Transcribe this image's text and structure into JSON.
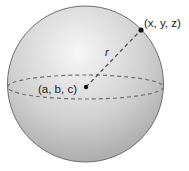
{
  "diagram": {
    "type": "sphere",
    "center_label": "(a, b, c)",
    "surface_point_label": "(x, y, z)",
    "radius_label": "r",
    "colors": {
      "sphere_fill_light": "#f4f4f4",
      "sphere_fill_dark": "#a8a8a8",
      "outline": "#6e6e6e",
      "dash": "#707070",
      "point": "#111111"
    }
  }
}
